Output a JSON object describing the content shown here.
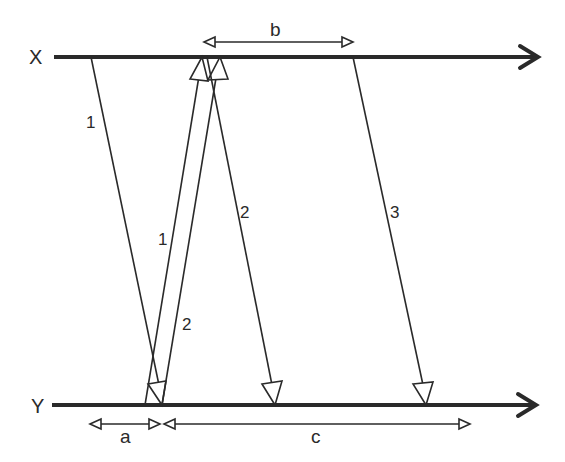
{
  "diagram": {
    "type": "timing-diagram",
    "axes": [
      {
        "id": "x",
        "label": "X"
      },
      {
        "id": "y",
        "label": "Y"
      }
    ],
    "signals": [
      {
        "id": "sig-1-down",
        "label": "1",
        "from": "X",
        "to": "Y"
      },
      {
        "id": "sig-1-up",
        "label": "1",
        "from": "Y",
        "to": "X"
      },
      {
        "id": "sig-2-up",
        "label": "2",
        "from": "Y",
        "to": "X"
      },
      {
        "id": "sig-2-down",
        "label": "2",
        "from": "X",
        "to": "Y"
      },
      {
        "id": "sig-3-down",
        "label": "3",
        "from": "X",
        "to": "Y"
      }
    ],
    "intervals": [
      {
        "id": "a",
        "label": "a",
        "axis": "Y"
      },
      {
        "id": "b",
        "label": "b",
        "axis": "X"
      },
      {
        "id": "c",
        "label": "c",
        "axis": "Y"
      }
    ],
    "colors": {
      "ink": "#2a2a2a",
      "background": "#ffffff"
    }
  }
}
